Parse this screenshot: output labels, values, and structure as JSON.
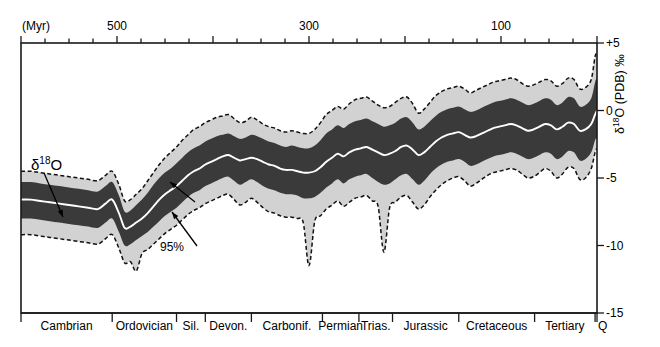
{
  "chart_data": {
    "type": "area",
    "title": "",
    "xlabel": "(Myr)",
    "ylabel": "δ¹⁸O (PDB) ‰",
    "xlim": [
      600,
      0
    ],
    "ylim": [
      -15,
      5
    ],
    "grid": false,
    "legend_position": "in-plot annotations",
    "top_axis": {
      "unit_label": "(Myr)",
      "major_ticks": [
        500,
        300,
        100
      ],
      "major_tick_labels": [
        "500",
        "300",
        "100"
      ],
      "all_ticks": [
        600,
        575,
        550,
        525,
        500,
        475,
        450,
        425,
        400,
        375,
        350,
        325,
        300,
        275,
        250,
        225,
        200,
        175,
        150,
        125,
        100,
        75,
        50,
        25,
        0
      ]
    },
    "right_axis": {
      "ticks": [
        5,
        0,
        -5,
        -10,
        -15
      ],
      "tick_labels": [
        "+5",
        "0",
        "-5",
        "-10",
        "-15"
      ],
      "title": "δ¹⁸O (PDB) ‰"
    },
    "annotations": [
      {
        "name": "delta-18-o",
        "text": "δ18O",
        "x": 560,
        "y": -3.0
      },
      {
        "name": "ci-68",
        "text": "68%",
        "x": 443,
        "y": -6.2
      },
      {
        "name": "ci-95",
        "text": "95%",
        "x": 438,
        "y": -9.6
      }
    ],
    "periods": [
      {
        "name": "Cambrian",
        "start": 600,
        "end": 505
      },
      {
        "name": "Ordovician",
        "start": 505,
        "end": 438
      },
      {
        "name": "Sil.",
        "start": 438,
        "end": 408
      },
      {
        "name": "Devon.",
        "start": 408,
        "end": 360
      },
      {
        "name": "Carbonif.",
        "start": 360,
        "end": 286
      },
      {
        "name": "Permian",
        "start": 286,
        "end": 248
      },
      {
        "name": "Trias.",
        "start": 248,
        "end": 213
      },
      {
        "name": "Jurassic",
        "start": 213,
        "end": 144
      },
      {
        "name": "Cretaceous",
        "start": 144,
        "end": 65
      },
      {
        "name": "Tertiary",
        "start": 65,
        "end": 2
      },
      {
        "name": "Q",
        "start": 2,
        "end": 0
      }
    ],
    "series": [
      {
        "name": "median",
        "style": "white line",
        "color": "#ffffff",
        "x": [
          600,
          590,
          580,
          570,
          560,
          550,
          540,
          530,
          520,
          512,
          505,
          498,
          492,
          486,
          480,
          474,
          468,
          462,
          456,
          450,
          444,
          438,
          432,
          426,
          420,
          414,
          408,
          402,
          396,
          390,
          384,
          378,
          372,
          366,
          360,
          354,
          348,
          342,
          336,
          330,
          324,
          318,
          312,
          306,
          300,
          294,
          288,
          282,
          276,
          270,
          264,
          258,
          252,
          246,
          240,
          234,
          228,
          222,
          216,
          210,
          204,
          198,
          192,
          186,
          180,
          174,
          168,
          162,
          156,
          150,
          144,
          138,
          132,
          126,
          120,
          114,
          108,
          102,
          96,
          90,
          84,
          78,
          72,
          66,
          60,
          54,
          48,
          42,
          36,
          30,
          24,
          18,
          12,
          6,
          2,
          0
        ],
        "values": [
          -6.6,
          -6.6,
          -6.7,
          -6.8,
          -6.9,
          -7.0,
          -7.1,
          -7.2,
          -7.3,
          -6.9,
          -6.6,
          -7.6,
          -8.7,
          -8.6,
          -8.3,
          -8.0,
          -7.6,
          -7.1,
          -6.6,
          -6.2,
          -5.9,
          -5.6,
          -5.2,
          -4.8,
          -4.5,
          -4.3,
          -4.0,
          -3.8,
          -3.6,
          -3.4,
          -3.3,
          -3.5,
          -3.7,
          -3.6,
          -3.5,
          -3.6,
          -3.8,
          -4.0,
          -4.1,
          -4.3,
          -4.4,
          -4.4,
          -4.5,
          -4.6,
          -4.6,
          -4.5,
          -4.2,
          -3.8,
          -3.5,
          -3.2,
          -3.4,
          -3.1,
          -2.9,
          -2.8,
          -2.7,
          -2.9,
          -3.1,
          -3.3,
          -3.2,
          -3.0,
          -2.7,
          -2.6,
          -2.9,
          -3.3,
          -3.1,
          -2.7,
          -2.3,
          -2.0,
          -1.8,
          -1.7,
          -1.6,
          -1.8,
          -2.0,
          -1.9,
          -1.7,
          -1.5,
          -1.3,
          -1.2,
          -1.1,
          -1.0,
          -1.1,
          -1.3,
          -1.5,
          -1.4,
          -1.2,
          -1.0,
          -1.1,
          -1.4,
          -1.2,
          -0.9,
          -1.0,
          -1.5,
          -1.4,
          -1.0,
          -0.3,
          0.0
        ]
      },
      {
        "name": "ci68_upper",
        "style": "dark band edge",
        "color": "#3a3a3a",
        "values": [
          -5.3,
          -5.3,
          -5.4,
          -5.5,
          -5.6,
          -5.7,
          -5.8,
          -5.9,
          -6.0,
          -5.6,
          -5.3,
          -6.3,
          -7.5,
          -7.4,
          -7.0,
          -6.6,
          -6.1,
          -5.5,
          -5.0,
          -4.6,
          -4.3,
          -3.9,
          -3.5,
          -3.1,
          -2.8,
          -2.6,
          -2.3,
          -2.1,
          -1.9,
          -1.8,
          -1.7,
          -1.9,
          -2.1,
          -2.0,
          -1.8,
          -1.9,
          -2.1,
          -2.3,
          -2.4,
          -2.6,
          -2.7,
          -2.6,
          -2.7,
          -2.8,
          -2.8,
          -2.6,
          -2.2,
          -1.7,
          -1.4,
          -1.1,
          -1.3,
          -1.0,
          -0.8,
          -0.7,
          -0.6,
          -0.8,
          -1.0,
          -1.2,
          -1.1,
          -0.9,
          -0.6,
          -0.5,
          -0.9,
          -1.4,
          -1.2,
          -0.8,
          -0.4,
          -0.1,
          0.1,
          0.2,
          0.3,
          0.1,
          -0.1,
          0.0,
          0.2,
          0.4,
          0.6,
          0.7,
          0.8,
          0.9,
          0.8,
          0.6,
          0.4,
          0.5,
          0.7,
          0.9,
          0.8,
          0.4,
          0.6,
          1.0,
          0.9,
          0.3,
          0.4,
          0.9,
          2.1,
          2.4
        ]
      },
      {
        "name": "ci68_lower",
        "style": "dark band edge",
        "color": "#3a3a3a",
        "values": [
          -8.0,
          -8.0,
          -8.1,
          -8.2,
          -8.3,
          -8.4,
          -8.5,
          -8.6,
          -8.7,
          -8.3,
          -8.0,
          -9.0,
          -10.0,
          -9.9,
          -9.6,
          -9.3,
          -9.0,
          -8.6,
          -8.2,
          -7.8,
          -7.5,
          -7.2,
          -6.8,
          -6.4,
          -6.1,
          -5.9,
          -5.6,
          -5.4,
          -5.2,
          -5.0,
          -4.9,
          -5.2,
          -5.5,
          -5.3,
          -5.1,
          -5.3,
          -5.6,
          -5.8,
          -5.9,
          -6.1,
          -6.2,
          -6.2,
          -6.3,
          -6.5,
          -6.5,
          -6.4,
          -6.1,
          -5.7,
          -5.4,
          -5.1,
          -5.4,
          -5.1,
          -4.9,
          -4.8,
          -4.7,
          -5.0,
          -5.3,
          -5.5,
          -5.4,
          -5.1,
          -4.8,
          -4.7,
          -5.1,
          -5.5,
          -5.2,
          -4.7,
          -4.3,
          -4.0,
          -3.8,
          -3.7,
          -3.6,
          -3.8,
          -4.1,
          -4.0,
          -3.8,
          -3.6,
          -3.4,
          -3.3,
          -3.2,
          -3.1,
          -3.2,
          -3.4,
          -3.6,
          -3.5,
          -3.3,
          -3.1,
          -3.2,
          -3.6,
          -3.4,
          -3.0,
          -3.1,
          -3.7,
          -3.6,
          -3.1,
          -2.2,
          -2.0
        ]
      },
      {
        "name": "ci95_upper",
        "style": "light band, dashed edge",
        "color": "#d2d2d2",
        "values": [
          -4.5,
          -4.5,
          -4.6,
          -4.7,
          -4.8,
          -4.9,
          -5.0,
          -5.1,
          -5.2,
          -4.8,
          -4.5,
          -5.5,
          -6.7,
          -6.6,
          -6.2,
          -5.8,
          -5.2,
          -4.6,
          -4.0,
          -3.5,
          -3.1,
          -2.7,
          -2.2,
          -1.8,
          -1.4,
          -1.2,
          -0.9,
          -0.7,
          -0.5,
          -0.4,
          -0.3,
          -0.6,
          -0.9,
          -0.8,
          -0.5,
          -0.7,
          -1.0,
          -1.2,
          -1.3,
          -1.5,
          -1.6,
          -1.5,
          -1.6,
          -1.7,
          -1.7,
          -1.4,
          -0.9,
          -0.3,
          0.0,
          0.3,
          0.1,
          0.5,
          0.8,
          0.9,
          1.0,
          0.7,
          0.4,
          0.2,
          0.3,
          0.6,
          0.9,
          1.0,
          0.5,
          -0.2,
          0.1,
          0.6,
          1.1,
          1.4,
          1.6,
          1.7,
          1.8,
          1.6,
          1.3,
          1.5,
          1.7,
          1.9,
          2.1,
          2.2,
          2.3,
          2.4,
          2.3,
          2.0,
          1.8,
          1.9,
          2.1,
          2.3,
          2.2,
          1.8,
          2.0,
          2.4,
          2.3,
          1.6,
          1.7,
          2.3,
          4.0,
          4.2
        ]
      },
      {
        "name": "ci95_lower",
        "style": "light band, dashed edge",
        "color": "#d2d2d2",
        "values": [
          -9.2,
          -9.2,
          -9.3,
          -9.4,
          -9.5,
          -9.6,
          -9.7,
          -9.8,
          -9.9,
          -9.5,
          -9.2,
          -10.2,
          -11.3,
          -11.2,
          -11.9,
          -10.6,
          -10.3,
          -9.9,
          -9.5,
          -9.1,
          -8.8,
          -8.5,
          -8.1,
          -7.7,
          -7.4,
          -7.2,
          -6.9,
          -6.7,
          -6.5,
          -6.3,
          -6.2,
          -6.6,
          -7.0,
          -6.8,
          -6.5,
          -6.8,
          -7.2,
          -7.5,
          -7.6,
          -7.8,
          -7.9,
          -7.9,
          -8.0,
          -8.3,
          -11.5,
          -8.2,
          -7.8,
          -7.3,
          -7.0,
          -6.7,
          -7.1,
          -6.8,
          -6.5,
          -6.4,
          -6.3,
          -6.7,
          -7.1,
          -10.5,
          -7.2,
          -6.8,
          -6.4,
          -6.3,
          -6.8,
          -7.3,
          -7.0,
          -6.4,
          -5.9,
          -5.5,
          -5.2,
          -5.0,
          -4.9,
          -5.2,
          -5.6,
          -5.4,
          -5.1,
          -4.8,
          -4.6,
          -4.5,
          -4.4,
          -4.3,
          -4.4,
          -4.7,
          -5.0,
          -4.9,
          -4.6,
          -4.3,
          -4.5,
          -5.0,
          -4.7,
          -4.2,
          -4.3,
          -5.1,
          -5.0,
          -4.3,
          -3.1,
          -2.8
        ]
      }
    ]
  },
  "colors": {
    "band_95": "#d2d2d2",
    "band_68": "#3a3a3a",
    "median_line": "#ffffff",
    "axis": "#1a1a1a",
    "text": "#000000"
  }
}
